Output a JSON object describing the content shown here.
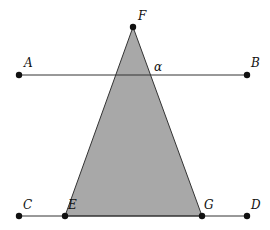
{
  "diagram": {
    "type": "geometry",
    "colors": {
      "fill": "#a8a8a8",
      "stroke": "#333333",
      "point": "#111111",
      "background": "#ffffff"
    },
    "points": {
      "A": {
        "label": "A",
        "x": 19,
        "y": 75
      },
      "B": {
        "label": "B",
        "x": 247,
        "y": 75
      },
      "C": {
        "label": "C",
        "x": 19,
        "y": 216
      },
      "D": {
        "label": "D",
        "x": 247,
        "y": 216
      },
      "E": {
        "label": "E",
        "x": 65,
        "y": 216
      },
      "F": {
        "label": "F",
        "x": 133,
        "y": 27
      },
      "G": {
        "label": "G",
        "x": 202,
        "y": 216
      }
    },
    "angle_label": "α",
    "lines": [
      "AB",
      "CD"
    ],
    "triangle": [
      "F",
      "E",
      "G"
    ]
  }
}
